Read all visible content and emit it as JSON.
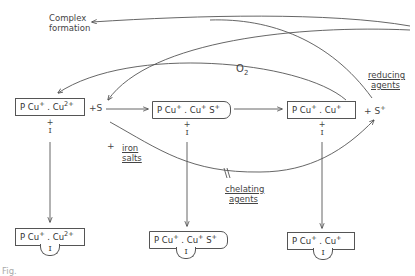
{
  "labels": {
    "complex_formation_1": "Complex",
    "complex_formation_2": "formation",
    "o2": "O",
    "o2_sub": "2",
    "reducing_1": "reducing",
    "reducing_2": "agents",
    "iron_1": "iron",
    "iron_2": "salts",
    "chelating_1": "chelating",
    "chelating_2": "agents",
    "plus": "+",
    "plus_s": "+S",
    "plus_s_plus": "+ S",
    "s_plus_sup": "+",
    "break_mark": "//"
  },
  "top_row": [
    {
      "id": "A",
      "p": "P Cu",
      "p_sup": "+",
      "sep": ". Cu",
      "sep_sup": "2+",
      "tail": ""
    },
    {
      "id": "B",
      "p": "P Cu",
      "p_sup": "+",
      "sep": ". Cu",
      "sep_sup": "+",
      "tail": "S",
      "tail_sup": "+"
    },
    {
      "id": "C",
      "p": "P Cu",
      "p_sup": "+",
      "sep": ". Cu",
      "sep_sup": "+",
      "tail": ""
    }
  ],
  "bottom_row": [
    {
      "id": "A-I",
      "p": "P Cu",
      "p_sup": "+",
      "sep": ". Cu",
      "sep_sup": "2+",
      "tail": "",
      "ligand": "I"
    },
    {
      "id": "B-I",
      "p": "P Cu",
      "p_sup": "+",
      "sep": ". Cu",
      "sep_sup": "+",
      "tail": "S",
      "tail_sup": "+",
      "ligand": "I"
    },
    {
      "id": "C-I",
      "p": "P Cu",
      "p_sup": "+",
      "sep": ". Cu",
      "sep_sup": "+",
      "tail": "",
      "ligand": "I"
    }
  ],
  "inhibitor": {
    "plus": "+",
    "symbol": "I"
  },
  "caption": "Fig."
}
